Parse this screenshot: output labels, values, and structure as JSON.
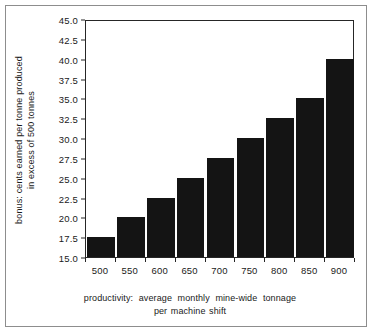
{
  "chart_data": {
    "type": "bar",
    "title": "",
    "subtitle": "",
    "categories": [
      "500",
      "550",
      "600",
      "650",
      "700",
      "750",
      "800",
      "850",
      "900"
    ],
    "values": [
      17.5,
      20.0,
      22.5,
      25.0,
      27.5,
      30.0,
      32.5,
      35.0,
      40.0
    ],
    "series": [
      {
        "name": "bonus",
        "values": [
          17.5,
          20.0,
          22.5,
          25.0,
          27.5,
          30.0,
          32.5,
          35.0,
          40.0
        ]
      }
    ],
    "xlabel": "productivity:  average  monthly  mine-wide  tonnage per machine shift",
    "ylabel": "bonus: cents earned per tonne produced in excess of 500 tonnes",
    "ylim": [
      15.0,
      45.0
    ],
    "ytick_step": 2.5,
    "yticks": [
      "45.0",
      "42.5",
      "40.0",
      "37.5",
      "35.0",
      "32.5",
      "30.0",
      "27.5",
      "25.0",
      "22.5",
      "20.0",
      "17.5",
      "15.0"
    ],
    "ytick_values": [
      45.0,
      42.5,
      40.0,
      37.5,
      35.0,
      32.5,
      30.0,
      27.5,
      25.0,
      22.5,
      20.0,
      17.5,
      15.0
    ],
    "xticks": [
      "500",
      "550",
      "600",
      "650",
      "700",
      "750",
      "800",
      "850",
      "900"
    ],
    "grid": false,
    "legend": null,
    "bar_color": "#141414",
    "axis_color": "#262626",
    "frame_color": "#8d8d8d"
  },
  "axes": {
    "y_title_line1": "bonus: cents earned per tonne produced",
    "y_title_line2": "in excess of 500 tonnes",
    "x_title_line1": "productivity:  average  monthly  mine-wide  tonnage",
    "x_title_line2": "per machine shift"
  }
}
